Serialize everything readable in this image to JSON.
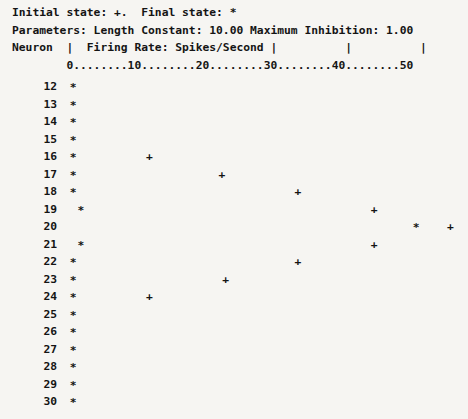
{
  "header": {
    "legend_line": "Initial state: +.  Final state: *",
    "parameters_line": "Parameters: Length Constant: 10.00 Maximum Inhibition: 1.00",
    "columns_line": "Neuron  |  Firing Rate: Spikes/Second |          |          |",
    "ruler_line": "        0........10........20........30........40........50",
    "initial_state_symbol": "+",
    "final_state_symbol": "*",
    "length_constant": "10.00",
    "maximum_inhibition": "1.00",
    "neuron_column_label": "Neuron",
    "rate_column_label": "Firing Rate: Spikes/Second"
  },
  "chart_data": {
    "type": "scatter",
    "title": "Firing Rate: Spikes/Second",
    "xlabel": "Firing Rate: Spikes/Second",
    "ylabel": "Neuron",
    "xlim": [
      0,
      50
    ],
    "xticks": [
      0,
      10,
      20,
      30,
      40,
      50
    ],
    "xtick_labels": [
      "0",
      "10",
      "20",
      "30",
      "40",
      "50"
    ],
    "grid": false,
    "legend": [
      {
        "symbol": "+",
        "name": "Initial state"
      },
      {
        "symbol": "*",
        "name": "Final state"
      }
    ],
    "categories": [
      12,
      13,
      14,
      15,
      16,
      17,
      18,
      19,
      20,
      21,
      22,
      23,
      24,
      25,
      26,
      27,
      28,
      29,
      30
    ],
    "series": [
      {
        "name": "Final state",
        "symbol": "*",
        "values": [
          0.5,
          0.5,
          0.5,
          0.5,
          0.5,
          0.5,
          0.5,
          1.5,
          45.5,
          1.5,
          0.5,
          0.5,
          0.5,
          0.5,
          0.5,
          0.5,
          0.5,
          0.5,
          0.5
        ]
      },
      {
        "name": "Initial state",
        "symbol": "+",
        "values": [
          null,
          null,
          null,
          null,
          10.5,
          20.0,
          30.0,
          40.0,
          50.0,
          40.0,
          30.0,
          20.5,
          10.5,
          null,
          null,
          null,
          null,
          null,
          null
        ]
      }
    ]
  },
  "rows": [
    {
      "neuron": "12",
      "final": 0.5,
      "initial": null
    },
    {
      "neuron": "13",
      "final": 0.5,
      "initial": null
    },
    {
      "neuron": "14",
      "final": 0.5,
      "initial": null
    },
    {
      "neuron": "15",
      "final": 0.5,
      "initial": null
    },
    {
      "neuron": "16",
      "final": 0.5,
      "initial": 10.5
    },
    {
      "neuron": "17",
      "final": 0.5,
      "initial": 20.0
    },
    {
      "neuron": "18",
      "final": 0.5,
      "initial": 30.0
    },
    {
      "neuron": "19",
      "final": 1.5,
      "initial": 40.0
    },
    {
      "neuron": "20",
      "final": 45.5,
      "initial": 50.0
    },
    {
      "neuron": "21",
      "final": 1.5,
      "initial": 40.0
    },
    {
      "neuron": "22",
      "final": 0.5,
      "initial": 30.0
    },
    {
      "neuron": "23",
      "final": 0.5,
      "initial": 20.5
    },
    {
      "neuron": "24",
      "final": 0.5,
      "initial": 10.5
    },
    {
      "neuron": "25",
      "final": 0.5,
      "initial": null
    },
    {
      "neuron": "26",
      "final": 0.5,
      "initial": null
    },
    {
      "neuron": "27",
      "final": 0.5,
      "initial": null
    },
    {
      "neuron": "28",
      "final": 0.5,
      "initial": null
    },
    {
      "neuron": "29",
      "final": 0.5,
      "initial": null
    },
    {
      "neuron": "30",
      "final": 0.5,
      "initial": null
    }
  ],
  "symbols": {
    "final": "*",
    "initial": "+"
  },
  "layout": {
    "origin_x": 66,
    "px_per_unit": 7.62,
    "first_row_y": 80,
    "row_pitch": 17.5
  }
}
